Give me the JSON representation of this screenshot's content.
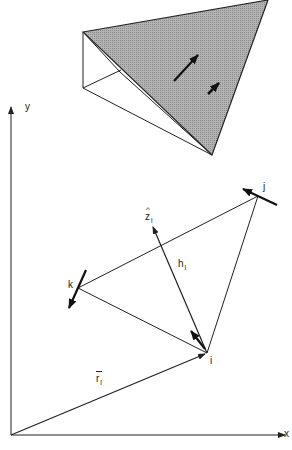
{
  "figure": {
    "type": "geometric-vector-diagram",
    "axes": {
      "x_label": "x",
      "y_label": "y"
    },
    "vertices": {
      "i": {
        "label": "i",
        "x": 207,
        "y": 353
      },
      "j": {
        "label": "j",
        "x": 258,
        "y": 196
      },
      "k": {
        "label": "k",
        "x": 78,
        "y": 288
      }
    },
    "vectors": {
      "normal": {
        "label": "z",
        "hat": "^",
        "subscript": "l"
      },
      "height": {
        "label": "h",
        "subscript": "l"
      },
      "position": {
        "label": "r",
        "bar": "‾",
        "subscript": "l"
      }
    },
    "inset": {
      "description": "Shaded triangular prism element showing surface vectors",
      "fill_color": "#a9a9a9"
    },
    "caption": ""
  },
  "colors": {
    "line": "#222222",
    "shade": "#a9a9a9",
    "background": "#ffffff"
  }
}
